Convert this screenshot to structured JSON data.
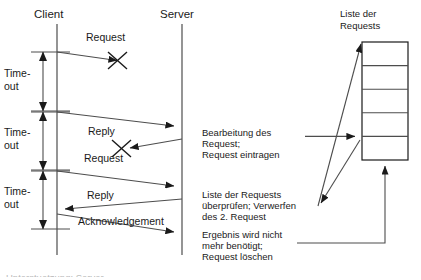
{
  "diagram": {
    "type": "sequence-diagram",
    "title_visible": false,
    "participants": [
      {
        "id": "client",
        "label": "Client",
        "lifeline_x": 57
      },
      {
        "id": "server",
        "label": "Server",
        "lifeline_x": 182
      }
    ],
    "timeout_brackets": [
      {
        "label_line1": "Time-",
        "label_line2": "out",
        "y_top": 52,
        "y_bottom": 111
      },
      {
        "label_line1": "Time-",
        "label_line2": "out",
        "y_top": 112,
        "y_bottom": 170
      },
      {
        "label_line1": "Time-",
        "label_line2": "out",
        "y_top": 171,
        "y_bottom": 229
      }
    ],
    "messages": [
      {
        "label": "Request",
        "from": "client",
        "to": "server",
        "lost": true
      },
      {
        "label": "Request",
        "from": "client",
        "to": "server",
        "lost": false
      },
      {
        "label": "Reply",
        "from": "server",
        "to": "client",
        "lost": true
      },
      {
        "label": "Request",
        "from": "client",
        "to": "server",
        "lost": false
      },
      {
        "label": "Reply",
        "from": "server",
        "to": "client",
        "lost": false
      },
      {
        "label": "Acknowledgement",
        "from": "client",
        "to": "server",
        "lost": false
      }
    ],
    "notes": [
      {
        "id": "note-processing",
        "lines": [
          "Bearbeitung des",
          "Request;",
          "Request eintragen"
        ]
      },
      {
        "id": "note-check-list",
        "lines": [
          "Liste der Requests",
          "überprüfen; Verwerfen",
          "des 2. Request"
        ]
      },
      {
        "id": "note-delete",
        "lines": [
          "Ergebnis wird nicht",
          "mehr benötigt;",
          "Request löschen"
        ]
      }
    ],
    "list": {
      "id": "request-list",
      "title_lines": [
        "Liste der",
        "Requests"
      ],
      "rows": [
        "",
        "",
        "",
        "",
        ""
      ]
    },
    "footer_cut_text": "Unterstuetzung: Server..."
  },
  "colors": {
    "stroke": "#1a1a1a",
    "line": "#4d4d4d",
    "background": "#ffffff",
    "text": "#1a1a1a",
    "faded_text": "#b9b9b9"
  }
}
